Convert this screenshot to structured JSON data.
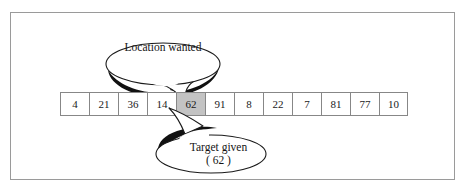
{
  "diagram": {
    "type": "array-search-illustration",
    "background_color": "#ffffff",
    "frame_color": "#9a9a9a",
    "cell_border_color": "#878787",
    "highlight_color": "#c3c3c3",
    "bubble_outline_color": "#1a1a1a",
    "bubble_shadow_color": "#111111"
  },
  "array": {
    "name": "search-array",
    "length": 12,
    "cells": [
      {
        "index": 0,
        "value": "4",
        "highlighted": false
      },
      {
        "index": 1,
        "value": "21",
        "highlighted": false
      },
      {
        "index": 2,
        "value": "36",
        "highlighted": false
      },
      {
        "index": 3,
        "value": "14",
        "highlighted": false
      },
      {
        "index": 4,
        "value": "62",
        "highlighted": true
      },
      {
        "index": 5,
        "value": "91",
        "highlighted": false
      },
      {
        "index": 6,
        "value": "8",
        "highlighted": false
      },
      {
        "index": 7,
        "value": "22",
        "highlighted": false
      },
      {
        "index": 8,
        "value": "7",
        "highlighted": false
      },
      {
        "index": 9,
        "value": "81",
        "highlighted": false
      },
      {
        "index": 10,
        "value": "77",
        "highlighted": false
      },
      {
        "index": 11,
        "value": "10",
        "highlighted": false
      }
    ]
  },
  "callouts": {
    "top": {
      "label": "Location wanted",
      "points_to_cell_index": 4,
      "tail_direction": "down-right"
    },
    "bottom": {
      "line1": "Target given",
      "line2": "( 62 )",
      "points_to_cell_index": 4,
      "tail_direction": "up"
    }
  }
}
